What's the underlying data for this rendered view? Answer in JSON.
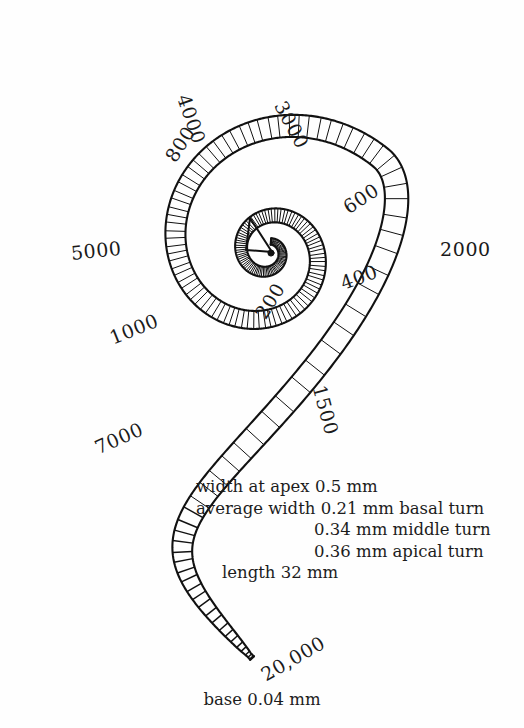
{
  "figure": {
    "background_color": "#fefefe",
    "ink_color": "#111111"
  },
  "chart_data": {
    "type": "scatter",
    "xlabel": "",
    "ylabel": "",
    "units": "Hz",
    "categories": [
      "200",
      "400",
      "600",
      "800",
      "1000",
      "1500",
      "2000",
      "3000",
      "4000",
      "5000",
      "7000",
      "20,000"
    ],
    "values": [
      200,
      400,
      600,
      800,
      1000,
      1500,
      2000,
      3000,
      4000,
      5000,
      7000,
      20000
    ],
    "series": [
      {
        "name": "characteristic frequency (Hz)",
        "values": [
          200,
          400,
          600,
          800,
          1000,
          1500,
          2000,
          3000,
          4000,
          5000,
          7000,
          20000
        ]
      }
    ],
    "annotations": [
      "width at apex 0.5 mm",
      "average width 0.21 mm basal turn",
      "0.34 mm middle turn",
      "0.36 mm apical turn",
      "length 32 mm",
      "base 0.04 mm"
    ]
  },
  "frequency_labels": [
    {
      "id": "f-200",
      "text": "200",
      "x": 252,
      "y": 312,
      "rotate": -58
    },
    {
      "id": "f-400",
      "text": "400",
      "x": 338,
      "y": 275,
      "rotate": -20
    },
    {
      "id": "f-600",
      "text": "600",
      "x": 340,
      "y": 201,
      "rotate": -33
    },
    {
      "id": "f-800",
      "text": "800",
      "x": 162,
      "y": 155,
      "rotate": -57
    },
    {
      "id": "f-1000",
      "text": "1000",
      "x": 107,
      "y": 330,
      "rotate": -22
    },
    {
      "id": "f-1500",
      "text": "1500",
      "x": 328,
      "y": 383,
      "rotate": 75
    },
    {
      "id": "f-2000",
      "text": "2000",
      "x": 440,
      "y": 240,
      "rotate": 0
    },
    {
      "id": "f-3000",
      "text": "3000",
      "x": 288,
      "y": 98,
      "rotate": 62
    },
    {
      "id": "f-4000",
      "text": "4000",
      "x": 192,
      "y": 92,
      "rotate": 71
    },
    {
      "id": "f-5000",
      "text": "5000",
      "x": 70,
      "y": 244,
      "rotate": -6
    },
    {
      "id": "f-7000",
      "text": "7000",
      "x": 92,
      "y": 440,
      "rotate": -24
    },
    {
      "id": "f-20000",
      "text": "20,000",
      "x": 258,
      "y": 668,
      "rotate": -30
    }
  ],
  "measurements": {
    "line1": "width at apex 0.5 mm",
    "line2": "average width 0.21 mm basal turn",
    "line3": "0.34 mm middle turn",
    "line4": "0.36 mm apical turn",
    "line5": "length 32 mm"
  },
  "base_caption": "base 0.04 mm"
}
